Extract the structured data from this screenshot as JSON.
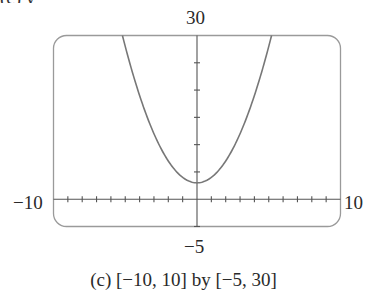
{
  "header_cutoff_text": "(c)                                              y",
  "chart_data": {
    "type": "line",
    "title": "",
    "caption": "(c) [−10, 10] by [−5, 30]",
    "xlabel": "",
    "ylabel": "",
    "xlim": [
      -10,
      10
    ],
    "ylim": [
      -5,
      30
    ],
    "x_tick_step": 1,
    "y_tick_step": 5,
    "grid": false,
    "legend": null,
    "window_labels": {
      "xmin": "−10",
      "xmax": "10",
      "ymin": "−5",
      "ymax": "30"
    },
    "series": [
      {
        "name": "parabola",
        "equation_estimate": "y = x^2 + 3",
        "vertex": [
          0,
          3
        ],
        "x": [
          -5.2,
          -5,
          -4,
          -3,
          -2,
          -1,
          0,
          1,
          2,
          3,
          4,
          5,
          5.2
        ],
        "y": [
          30,
          28,
          19,
          12,
          7,
          4,
          3,
          4,
          7,
          12,
          19,
          28,
          30
        ]
      }
    ]
  },
  "colors": {
    "frame": "#9a9a9a",
    "axes": "#555555",
    "curve": "#777777",
    "text": "#2a2a2a"
  }
}
